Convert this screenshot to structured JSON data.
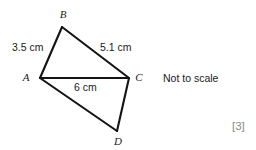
{
  "figure": {
    "background_color": "#ffffff",
    "line_color": "#141414",
    "text_color": "#1a1a1a",
    "marks_color": "#8a8a8a",
    "vertices": [
      {
        "name": "B",
        "label": "B",
        "x": 62,
        "y": 27,
        "label_x": 63,
        "label_y": 18
      },
      {
        "name": "A",
        "label": "A",
        "x": 40,
        "y": 78,
        "label_x": 26,
        "label_y": 81
      },
      {
        "name": "C",
        "label": "C",
        "x": 129,
        "y": 78,
        "label_x": 137,
        "label_y": 81
      },
      {
        "name": "D",
        "label": "D",
        "x": 117,
        "y": 131,
        "label_x": 113,
        "label_y": 145
      }
    ],
    "edges": [
      {
        "name": "edge-AB",
        "from": "A",
        "to": "B"
      },
      {
        "name": "edge-BC",
        "from": "B",
        "to": "C"
      },
      {
        "name": "edge-AC",
        "from": "A",
        "to": "C"
      },
      {
        "name": "edge-AD",
        "from": "A",
        "to": "D"
      },
      {
        "name": "edge-DC",
        "from": "D",
        "to": "C"
      }
    ],
    "measurements": [
      {
        "name": "length-AB",
        "edge": "AB",
        "text": "3.5 cm",
        "x": 12,
        "y": 51
      },
      {
        "name": "length-BC",
        "edge": "BC",
        "text": "5.1 cm",
        "x": 100,
        "y": 51
      },
      {
        "name": "length-AC",
        "edge": "AC",
        "text": "6 cm",
        "x": 74,
        "y": 91
      }
    ],
    "annotations": {
      "not_to_scale": "Not to scale",
      "not_to_scale_x": 163,
      "not_to_scale_y": 82,
      "marks": "[3]",
      "marks_x": 232,
      "marks_y": 130
    }
  }
}
